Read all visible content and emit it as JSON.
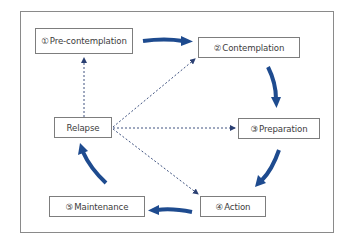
{
  "diagram": {
    "colors": {
      "arrow": "#1e4b8f",
      "dashed": "#2a3f72",
      "box_border": "#7d7d7d",
      "text": "#3c3c3c"
    },
    "stages": [
      {
        "id": "pre-contemplation",
        "number": "①",
        "label": "Pre-contemplation"
      },
      {
        "id": "contemplation",
        "number": "②",
        "label": "Contemplation"
      },
      {
        "id": "preparation",
        "number": "③",
        "label": "Preparation"
      },
      {
        "id": "action",
        "number": "④",
        "label": "Action"
      },
      {
        "id": "maintenance",
        "number": "⑤",
        "label": "Maintenance"
      },
      {
        "id": "relapse",
        "number": "",
        "label": "Relapse"
      }
    ],
    "solid_arrows": [
      {
        "from": "pre-contemplation",
        "to": "contemplation"
      },
      {
        "from": "contemplation",
        "to": "preparation"
      },
      {
        "from": "preparation",
        "to": "action"
      },
      {
        "from": "action",
        "to": "maintenance"
      },
      {
        "from": "maintenance",
        "to": "relapse"
      }
    ],
    "dashed_arrows": [
      {
        "from": "relapse",
        "to": "pre-contemplation"
      },
      {
        "from": "relapse",
        "to": "contemplation"
      },
      {
        "from": "relapse",
        "to": "preparation"
      },
      {
        "from": "relapse",
        "to": "action"
      }
    ]
  }
}
